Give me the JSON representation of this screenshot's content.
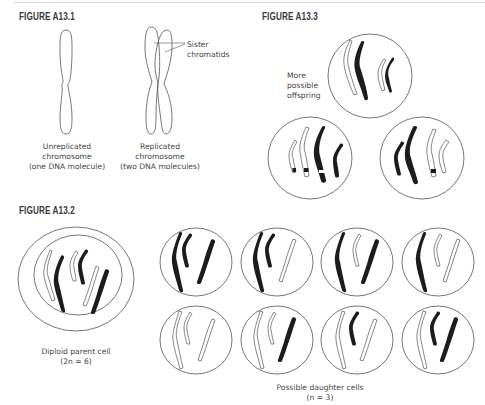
{
  "figures": {
    "a13_1": {
      "title": "FIGURE A13.1",
      "unreplicated_caption": [
        "Unreplicated",
        "chromosome",
        "(one DNA molecule)"
      ],
      "replicated_caption": [
        "Replicated",
        "chromosome",
        "(two DNA molecules)"
      ],
      "sister_label": [
        "Sister",
        "chromatids"
      ]
    },
    "a13_2": {
      "title": "FIGURE A13.2",
      "parent_caption": [
        "Diploid parent cell",
        "(2n = 6)"
      ],
      "daughter_caption": [
        "Possible daughter cells",
        "(n = 3)"
      ],
      "daughter_cells": [
        {
          "row": 1,
          "col": 1,
          "long": "black",
          "short": "black",
          "medium": "black"
        },
        {
          "row": 1,
          "col": 2,
          "long": "black",
          "short": "black",
          "medium": "white"
        },
        {
          "row": 1,
          "col": 3,
          "long": "black",
          "short": "white",
          "medium": "black"
        },
        {
          "row": 1,
          "col": 4,
          "long": "black",
          "short": "white",
          "medium": "white"
        },
        {
          "row": 2,
          "col": 1,
          "long": "white",
          "short": "white",
          "medium": "white"
        },
        {
          "row": 2,
          "col": 2,
          "long": "white",
          "short": "white",
          "medium": "black"
        },
        {
          "row": 2,
          "col": 3,
          "long": "white",
          "short": "black",
          "medium": "white"
        },
        {
          "row": 2,
          "col": 4,
          "long": "white",
          "short": "black",
          "medium": "black"
        }
      ]
    },
    "a13_3": {
      "title": "FIGURE A13.3",
      "offspring_label": [
        "More",
        "possible",
        "offspring"
      ]
    }
  },
  "colors": {
    "ink": "#222222",
    "outline": "#555555",
    "title": "#3a3a3a",
    "rule": "#d8d8d8"
  }
}
